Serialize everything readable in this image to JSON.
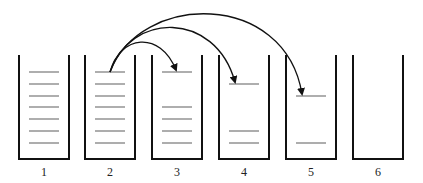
{
  "diagram": {
    "containers": [
      {
        "label": "1",
        "x": 19,
        "levels": [
          72,
          84,
          96,
          107,
          119,
          131,
          143
        ]
      },
      {
        "label": "2",
        "x": 85,
        "levels": [
          72,
          84,
          96,
          107,
          119,
          131,
          143
        ]
      },
      {
        "label": "3",
        "x": 152,
        "levels": [
          72,
          107,
          119,
          131,
          143
        ]
      },
      {
        "label": "4",
        "x": 219,
        "levels": [
          84,
          131,
          143
        ]
      },
      {
        "label": "5",
        "x": 286,
        "levels": [
          96,
          143
        ]
      },
      {
        "label": "6",
        "x": 353,
        "levels": []
      }
    ],
    "arrows": [
      {
        "from": "2",
        "to": "3",
        "path": "M110,72 C120,35 160,30 176,70"
      },
      {
        "from": "2",
        "to": "4",
        "path": "M110,72 C130,12 215,10 235,82"
      },
      {
        "from": "2",
        "to": "5",
        "path": "M110,72 C140,-8 285,-10 302,94"
      }
    ],
    "colors": {
      "wall": "#111111",
      "level": "#777777",
      "arrow": "#111111"
    }
  }
}
